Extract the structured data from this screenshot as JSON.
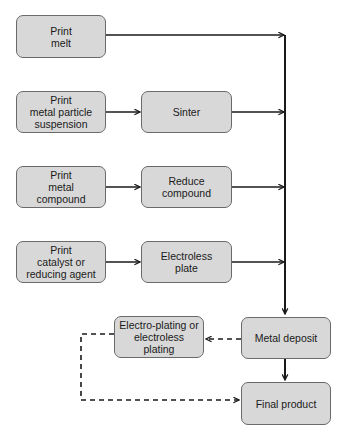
{
  "diagram": {
    "type": "flowchart",
    "nodes": {
      "print_melt": {
        "label": "Print\nmelt"
      },
      "print_particle": {
        "label": "Print\nmetal particle\nsuspension"
      },
      "sinter": {
        "label": "Sinter"
      },
      "print_compound": {
        "label": "Print\nmetal\ncompound"
      },
      "reduce_compound": {
        "label": "Reduce\ncompound"
      },
      "print_catalyst": {
        "label": "Print\ncatalyst or\nreducing agent"
      },
      "electroless_plate": {
        "label": "Electroless\nplate"
      },
      "metal_deposit": {
        "label": "Metal deposit"
      },
      "electro_plating": {
        "label": "Electro-plating or\nelectroless\nplating"
      },
      "final_product": {
        "label": "Final product"
      }
    },
    "edges": [
      {
        "from": "print_melt",
        "to": "metal_deposit",
        "style": "solid"
      },
      {
        "from": "print_particle",
        "to": "sinter",
        "style": "solid"
      },
      {
        "from": "sinter",
        "to": "metal_deposit",
        "style": "solid"
      },
      {
        "from": "print_compound",
        "to": "reduce_compound",
        "style": "solid"
      },
      {
        "from": "reduce_compound",
        "to": "metal_deposit",
        "style": "solid"
      },
      {
        "from": "print_catalyst",
        "to": "electroless_plate",
        "style": "solid"
      },
      {
        "from": "electroless_plate",
        "to": "metal_deposit",
        "style": "solid"
      },
      {
        "from": "metal_deposit",
        "to": "final_product",
        "style": "solid"
      },
      {
        "from": "metal_deposit",
        "to": "electro_plating",
        "style": "dashed"
      },
      {
        "from": "electro_plating",
        "to": "final_product",
        "style": "dashed"
      }
    ],
    "colors": {
      "node_fill": "#d8d8d8",
      "node_border": "#6a6a6a",
      "edge": "#1a1a1a"
    }
  }
}
